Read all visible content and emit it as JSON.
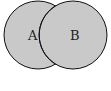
{
  "diagram": {
    "type": "venn",
    "sets": [
      {
        "label": "A",
        "cx": 38,
        "cy": 35,
        "r": 34
      },
      {
        "label": "B",
        "cx": 73,
        "cy": 35,
        "r": 34
      }
    ],
    "fill_color": "#c9c9c9",
    "stroke_color": "#111111"
  }
}
